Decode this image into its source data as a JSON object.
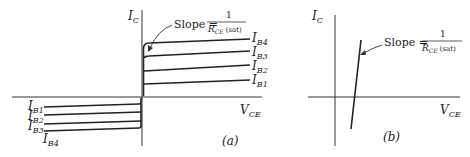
{
  "panel_a": {
    "y_axis_label": "I",
    "y_axis_sub": "C",
    "x_axis_label": "V",
    "x_axis_sub": "CE",
    "slope_prefix": "Slope =",
    "slope_num": "1",
    "slope_den_main": "R",
    "slope_den_sub": "CE",
    "slope_den_suffix": "(sat)",
    "tag": "(a)",
    "right_curves": [
      {
        "label": "I",
        "sub": "B4"
      },
      {
        "label": "I",
        "sub": "B3"
      },
      {
        "label": "I",
        "sub": "B2"
      },
      {
        "label": "I",
        "sub": "B1"
      }
    ],
    "left_curves": [
      {
        "label": "I",
        "sub": "B1"
      },
      {
        "label": "I",
        "sub": "B2"
      },
      {
        "label": "I",
        "sub": "B3"
      },
      {
        "label": "I",
        "sub": "B4"
      }
    ]
  },
  "panel_b": {
    "y_axis_label": "I",
    "y_axis_sub": "C",
    "x_axis_label": "V",
    "x_axis_sub": "CE",
    "slope_prefix": "Slope =",
    "slope_num": "1",
    "slope_den_main": "R",
    "slope_den_sub": "CE",
    "slope_den_suffix": "(sat)",
    "tag": "(b)"
  }
}
